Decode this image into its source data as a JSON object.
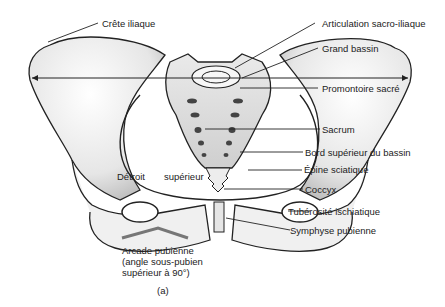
{
  "figure": {
    "caption": "(a)"
  },
  "labels": {
    "crete_iliaque": "Crête iliaque",
    "articulation": "Articulation sacro-iliaque",
    "grand_bassin": "Grand bassin",
    "promontoire": "Promontoire sacré",
    "sacrum": "Sacrum",
    "bord_superieur": "Bord supérieur du bassin",
    "epine": "Épine sciatique",
    "coccyx": "Coccyx",
    "tuberosite": "Tubérosité ischiatique",
    "symphyse": "Symphyse pubienne",
    "detroit_1": "Détroit",
    "detroit_2": "supérieur",
    "arcade_1": "Arcade pubienne",
    "arcade_2": "(angle sous-pubien",
    "arcade_3": "supérieur à 90°)"
  },
  "colors": {
    "line": "#222222",
    "bone_fill": "#f2f2f2",
    "bone_shade": "#cfcfcf",
    "arcade_mark": "#777777"
  }
}
